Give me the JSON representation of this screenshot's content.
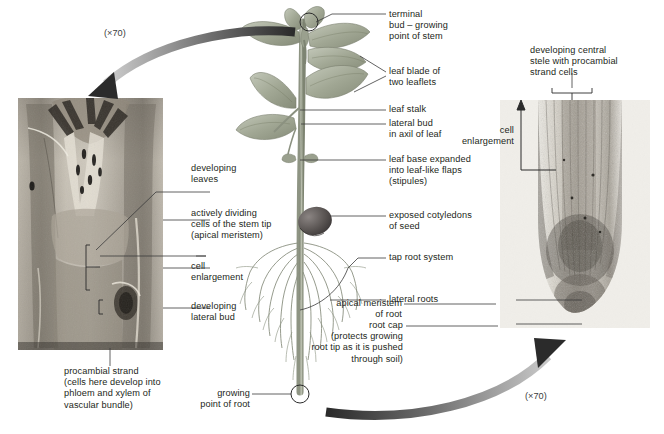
{
  "figure": {
    "magnification_top": "(×70)",
    "magnification_bottom": "(×70)"
  },
  "labels": {
    "terminal_bud": "terminal\nbud – growing\npoint of stem",
    "leaf_blade": "leaf blade of\ntwo leaflets",
    "leaf_stalk": "leaf stalk",
    "lateral_bud": "lateral bud\nin axil of leaf",
    "leaf_base": "leaf base expanded\ninto leaf-like flaps\n(stipules)",
    "cotyledons": "exposed cotyledons\nof seed",
    "tap_root": "tap root system",
    "lateral_roots": "lateral roots",
    "growing_point_root": "growing\npoint of root",
    "developing_leaves": "developing\nleaves",
    "apical_meristem_stem": "actively dividing\ncells of the stem tip\n(apical meristem)",
    "cell_enlargement_left": "cell\nenlargement",
    "developing_lateral_bud": "developing\nlateral bud",
    "procambial_strand": "procambial strand\n(cells here develop into\nphloem and xylem of\nvascular bundle)",
    "developing_stele": "developing central\nstele with procambial\nstrand cells",
    "cell_enlargement_right": "cell\nenlargement",
    "apical_meristem_root": "apical meristem\nof root",
    "root_cap": "root cap\n(protects growing\nroot tip as it is pushed\nthrough soil)"
  },
  "icons": {
    "circle_marker_stem": "circle-marker-icon",
    "circle_marker_root": "circle-marker-icon",
    "arrow_top": "curved-arrow-icon",
    "arrow_bottom": "curved-arrow-icon",
    "bracket_cell_enlargement": "bracket-icon",
    "bracket_stele": "bracket-icon",
    "arrow_cell_enlargement": "double-arrow-icon"
  },
  "colors": {
    "text": "#231f20",
    "leader_line": "#3a3a3a",
    "arrow_dark": "#2b2b2b",
    "arrow_light": "#b9b9b9",
    "plant_green": "#9aa08e",
    "seed_dark": "#4f4a4a",
    "micrograph_bg": "#cfc9bf"
  }
}
